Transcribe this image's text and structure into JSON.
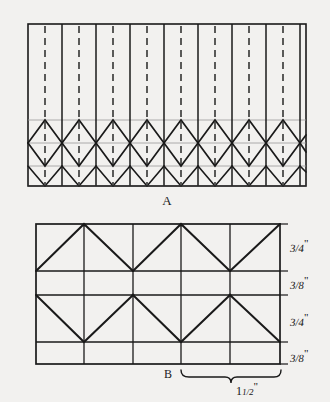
{
  "figure_a": {
    "label": "A",
    "description": "repeating hexagon / parquet block pattern with alternating solid and dashed vertical joint lines",
    "frame": {
      "x": 28,
      "y": 24,
      "width": 278,
      "height": 162
    },
    "bands": {
      "top_plain_y": 120,
      "hex_upper_y": 143,
      "hex_lower_y": 166,
      "bottom_plain_y": 186
    },
    "vertical_lines_solid_x": [
      28,
      62,
      96,
      130,
      164,
      198,
      232,
      266,
      300,
      306
    ],
    "vertical_lines_dashed_x": [
      45,
      79,
      113,
      147,
      181,
      215,
      249,
      283
    ],
    "unit_width": 34,
    "hexagon_count": 8
  },
  "figure_b": {
    "label": "B",
    "description": "grid of courses with zigzag diagonal lines, dimensioned at right and below",
    "frame": {
      "x": 36,
      "y": 224,
      "width": 244,
      "height": 140
    },
    "horizontal_rule_y": [
      224,
      271,
      295,
      342,
      364
    ],
    "vertical_rule_x": [
      36,
      84,
      133,
      181,
      230,
      280
    ],
    "row_labels": [
      "3/4\"",
      "3/8\"",
      "3/4\"",
      "3/8\""
    ],
    "rows": [
      {
        "label_numerator": "3",
        "label_denominator": "4",
        "unit": "\"",
        "height_px": 47
      },
      {
        "label_numerator": "3",
        "label_denominator": "8",
        "unit": "\"",
        "height_px": 24
      },
      {
        "label_numerator": "3",
        "label_denominator": "4",
        "unit": "\"",
        "height_px": 47
      },
      {
        "label_numerator": "3",
        "label_denominator": "8",
        "unit": "\"",
        "height_px": 22
      }
    ],
    "width_dimension": {
      "whole": "1",
      "numerator": "1",
      "denominator": "2",
      "unit": "\"",
      "text": "1 1/2\"",
      "brace_from_x": 181,
      "brace_to_x": 281
    }
  },
  "colors": {
    "background": "#f2f1ef",
    "ink": "#1a1a1a",
    "ink_light": "#6b6b6b"
  }
}
